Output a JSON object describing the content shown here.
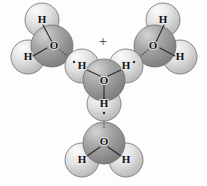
{
  "figure": {
    "width": 207,
    "height": 186,
    "background_color": "#fdfdfd",
    "render_style": "space-filling-cpk-grayscale"
  },
  "palette": {
    "oxygen_sphere_light": "#d9d9d9",
    "oxygen_sphere_mid": "#9a9a9a",
    "oxygen_sphere_dark": "#7d7d7d",
    "hydrogen_sphere_light": "#f2f2f2",
    "hydrogen_sphere_mid": "#d2d2d2",
    "hydrogen_sphere_dark": "#b4b4b4",
    "outline": "#6f6f6f",
    "label_color": "#111111",
    "bond_color": "#2b2b2b",
    "hbond_color": "#4a4a4a",
    "charge_color": "#3a3a3a"
  },
  "charge": {
    "symbol": "+",
    "x": 103,
    "y": 43,
    "belongs_to": "central-hydronium"
  },
  "molecules": [
    {
      "id": "water-upper-left",
      "role": "hydrogen-bond-acceptor",
      "formula": "H2O",
      "oxygen": {
        "label": "O",
        "x": 52,
        "y": 46,
        "r": 21
      },
      "hydrogens": [
        {
          "label": "H",
          "x": 42,
          "y": 20,
          "r": 17
        },
        {
          "label": "H",
          "x": 28,
          "y": 57,
          "r": 17
        }
      ]
    },
    {
      "id": "hydronium-center",
      "role": "hydrogen-bond-donor",
      "formula": "H3O+",
      "oxygen": {
        "label": "O",
        "x": 104,
        "y": 80,
        "r": 21
      },
      "hydrogens": [
        {
          "label": "H",
          "x": 82,
          "y": 66,
          "r": 17
        },
        {
          "label": "H",
          "x": 126,
          "y": 66,
          "r": 17
        },
        {
          "label": "H",
          "x": 104,
          "y": 104,
          "r": 17
        }
      ]
    },
    {
      "id": "water-upper-right",
      "role": "hydrogen-bond-acceptor",
      "formula": "H2O",
      "oxygen": {
        "label": "O",
        "x": 155,
        "y": 46,
        "r": 21
      },
      "hydrogens": [
        {
          "label": "H",
          "x": 163,
          "y": 20,
          "r": 17
        },
        {
          "label": "H",
          "x": 180,
          "y": 57,
          "r": 17
        }
      ]
    },
    {
      "id": "water-bottom",
      "role": "hydrogen-bond-acceptor",
      "formula": "H2O",
      "oxygen": {
        "label": "O",
        "x": 104,
        "y": 143,
        "r": 21
      },
      "hydrogens": [
        {
          "label": "H",
          "x": 82,
          "y": 160,
          "r": 17
        },
        {
          "label": "H",
          "x": 126,
          "y": 160,
          "r": 17
        }
      ]
    }
  ],
  "covalent_bonds": [
    {
      "from": "water-upper-left.O",
      "to": "water-upper-left.H1",
      "x1": 52,
      "y1": 42,
      "x2": 43,
      "y2": 25
    },
    {
      "from": "water-upper-left.O",
      "to": "water-upper-left.H2",
      "x1": 47,
      "y1": 48,
      "x2": 33,
      "y2": 56
    },
    {
      "from": "hydronium-center.O",
      "to": "hydronium-center.H1",
      "x1": 100,
      "y1": 76,
      "x2": 87,
      "y2": 70
    },
    {
      "from": "hydronium-center.O",
      "to": "hydronium-center.H2",
      "x1": 108,
      "y1": 76,
      "x2": 121,
      "y2": 70
    },
    {
      "from": "hydronium-center.O",
      "to": "hydronium-center.H3",
      "x1": 104,
      "y1": 85,
      "x2": 104,
      "y2": 99
    },
    {
      "from": "water-upper-right.O",
      "to": "water-upper-right.H1",
      "x1": 156,
      "y1": 42,
      "x2": 164,
      "y2": 25
    },
    {
      "from": "water-upper-right.O",
      "to": "water-upper-right.H2",
      "x1": 160,
      "y1": 48,
      "x2": 175,
      "y2": 56
    },
    {
      "from": "water-bottom.O",
      "to": "water-bottom.H1",
      "x1": 100,
      "y1": 147,
      "x2": 87,
      "y2": 156
    },
    {
      "from": "water-bottom.O",
      "to": "water-bottom.H2",
      "x1": 108,
      "y1": 147,
      "x2": 121,
      "y2": 156
    }
  ],
  "hydrogen_bonds": [
    {
      "id": "hbond-left",
      "from": "hydronium-center.H1",
      "to": "water-upper-left.O",
      "x1": 76,
      "y1": 63,
      "x2": 60,
      "y2": 50
    },
    {
      "id": "hbond-right",
      "from": "hydronium-center.H2",
      "to": "water-upper-right.O",
      "x1": 132,
      "y1": 63,
      "x2": 148,
      "y2": 50
    },
    {
      "id": "hbond-down",
      "from": "hydronium-center.H3",
      "to": "water-bottom.O",
      "x1": 104,
      "y1": 110,
      "x2": 104,
      "y2": 128
    }
  ],
  "lone_pair_dots": [
    {
      "near": "hydronium-center.H1",
      "x": 74,
      "y": 62
    },
    {
      "near": "hydronium-center.H2",
      "x": 134,
      "y": 62
    },
    {
      "near": "hydronium-center.H3",
      "x": 104,
      "y": 113
    }
  ],
  "legend": {
    "oxygen_symbol": "O",
    "hydrogen_symbol": "H",
    "charge_symbol": "+"
  }
}
